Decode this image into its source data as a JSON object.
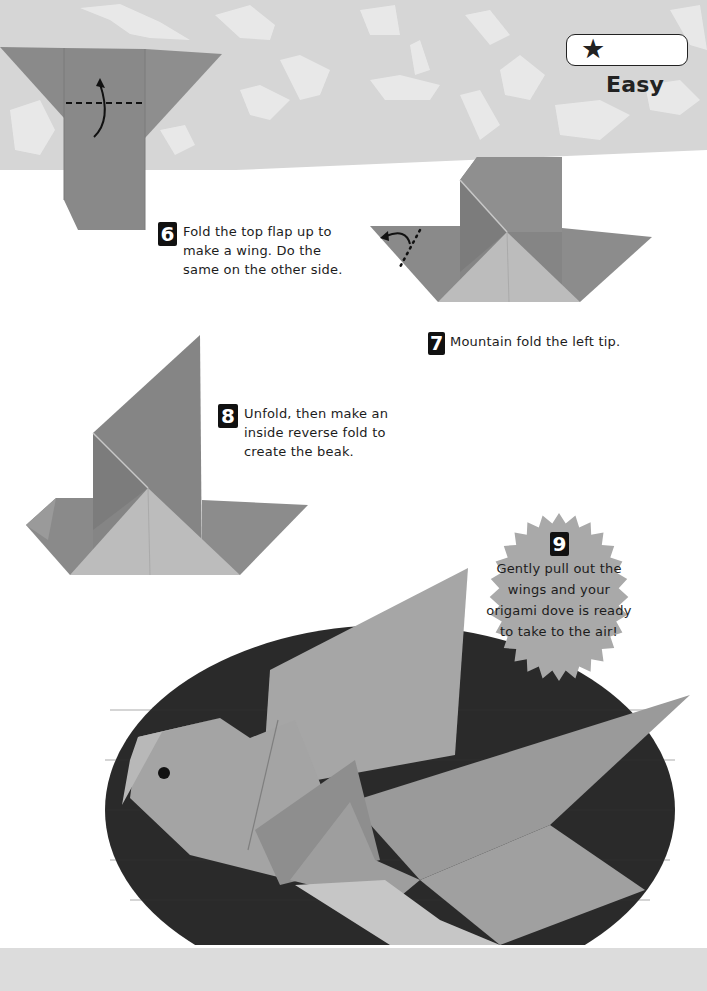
{
  "difficulty": {
    "stars": "★",
    "star_count": 1,
    "label": "Easy"
  },
  "steps": [
    {
      "number": "6",
      "text": "Fold the top flap up to make a wing. Do the same on the other side.",
      "lines": [
        "Fold the top flap up to",
        "make a wing. Do the",
        "same on the other side."
      ]
    },
    {
      "number": "7",
      "text": "Mountain fold the left tip.",
      "lines": [
        "Mountain fold the left tip."
      ]
    },
    {
      "number": "8",
      "text": "Unfold, then make an inside reverse fold to create the beak.",
      "lines": [
        "Unfold, then make an",
        "inside reverse fold to",
        "create the beak."
      ]
    },
    {
      "number": "9",
      "text": "Gently pull out the wings and your origami dove is ready to take to the air!",
      "lines": [
        "Gently pull out the",
        "wings and your",
        "origami dove is ready",
        "to take to the air!"
      ]
    }
  ],
  "colors": {
    "band": "#d6d6d6",
    "paper_dark": "#8a8a8a",
    "paper_light": "#bdbdbd",
    "paper_mid": "#a2a2a2",
    "oval": "#2a2a2a",
    "burst": "#a9a9a9",
    "ink": "#1c1c1c"
  },
  "diagrams": [
    {
      "id": "step6-diagram",
      "icons": [
        "valley-fold-dashed-line",
        "fold-up-arrow"
      ]
    },
    {
      "id": "step7-diagram",
      "icons": [
        "mountain-fold-dotted-line",
        "fold-arrow"
      ]
    },
    {
      "id": "step8-diagram",
      "icons": []
    },
    {
      "id": "finished-dove",
      "icons": [
        "dove-eye"
      ]
    }
  ]
}
